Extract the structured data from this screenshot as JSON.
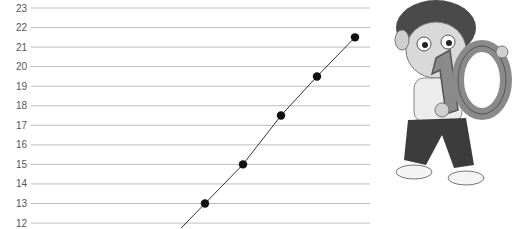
{
  "chart_data": {
    "type": "line",
    "title": "",
    "xlabel": "",
    "ylabel": "",
    "ylim": [
      12,
      23
    ],
    "yticks": [
      23,
      22,
      21,
      20,
      19,
      18,
      17,
      16,
      15,
      14,
      13,
      12
    ],
    "grid": true,
    "legend": null,
    "series": [
      {
        "name": "points",
        "points": [
          {
            "x": 205,
            "y": 13
          },
          {
            "x": 243,
            "y": 15
          },
          {
            "x": 281,
            "y": 17.5
          },
          {
            "x": 317,
            "y": 19.5
          },
          {
            "x": 355,
            "y": 21.5
          }
        ]
      }
    ],
    "annotations": [
      "cartoon boy holding number 10"
    ]
  },
  "illustration": {
    "label": "10"
  }
}
